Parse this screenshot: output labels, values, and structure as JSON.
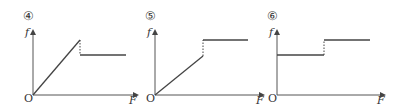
{
  "panels": [
    {
      "number_label": "④",
      "y_axis_label": "f",
      "x_axis_label": "F",
      "origin_label": "O",
      "description": "f rises linearly from origin, then drops (dashed) to a lower constant level"
    },
    {
      "number_label": "⑤",
      "y_axis_label": "f",
      "x_axis_label": "F",
      "origin_label": "O",
      "description": "f rises linearly from origin, then jumps (dashed) up to a higher constant level"
    },
    {
      "number_label": "⑥",
      "y_axis_label": "f",
      "x_axis_label": "F",
      "origin_label": "O",
      "description": "f constant at a level, then jumps (dashed) up to a higher constant level"
    }
  ],
  "colors": {
    "axis": "#555555",
    "curve": "#444444",
    "text": "#333333"
  }
}
